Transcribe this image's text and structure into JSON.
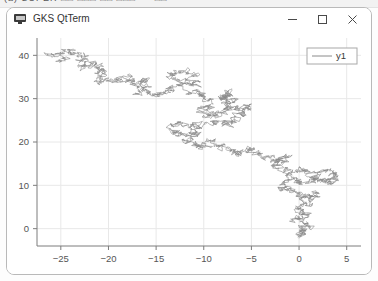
{
  "toolbar_sliver": {
    "text": "(a)  SUPER  □□  □□□  □□  □□□  • •  □□"
  },
  "window": {
    "title": "GKS QtTerm",
    "icon": "monitor-icon",
    "controls": {
      "minimize": "minimize-icon",
      "maximize": "maximize-icon",
      "close": "close-icon"
    }
  },
  "colors": {
    "line": "#8a8a8a",
    "grid": "#e8e8e8",
    "axis": "#7d7d7d",
    "tick_text": "#555555",
    "legend_border": "#a8a8a8",
    "window_border": "#b9b9b9",
    "background": "#ffffff"
  },
  "chart_data": {
    "type": "line",
    "title": "",
    "xlabel": "",
    "ylabel": "",
    "xlim": [
      -27.5,
      6.5
    ],
    "ylim": [
      -4.0,
      44.0
    ],
    "xticks": [
      -25,
      -20,
      -15,
      -10,
      -5,
      0,
      5
    ],
    "yticks": [
      0,
      10,
      20,
      30,
      40
    ],
    "xtick_labels": [
      "−25",
      "−20",
      "−15",
      "−10",
      "−5",
      "0",
      "5"
    ],
    "ytick_labels": [
      "0",
      "10",
      "20",
      "30",
      "40"
    ],
    "grid": true,
    "legend": {
      "position": "upper right",
      "entries": [
        {
          "label": "y1",
          "color": "#8a8a8a",
          "marker": "line"
        }
      ]
    },
    "series": [
      {
        "name": "y1",
        "description": "two-dimensional random walk trajectory",
        "color": "#8a8a8a",
        "linewidth": 0.6,
        "n_points": 2400,
        "start": [
          -24.5,
          39.0
        ],
        "end": [
          0.2,
          -1.5
        ],
        "seed": 20240517,
        "waypoints": [
          [
            -24.5,
            39.0
          ],
          [
            -25.6,
            40.2
          ],
          [
            -23.9,
            41.3
          ],
          [
            -22.4,
            39.6
          ],
          [
            -23.1,
            37.4
          ],
          [
            -21.6,
            38.1
          ],
          [
            -20.3,
            36.2
          ],
          [
            -21.4,
            34.7
          ],
          [
            -19.8,
            33.6
          ],
          [
            -18.2,
            34.9
          ],
          [
            -17.0,
            33.1
          ],
          [
            -15.8,
            34.4
          ],
          [
            -16.9,
            31.8
          ],
          [
            -15.1,
            30.6
          ],
          [
            -13.7,
            31.9
          ],
          [
            -12.4,
            33.6
          ],
          [
            -13.6,
            35.4
          ],
          [
            -12.0,
            36.1
          ],
          [
            -10.6,
            34.2
          ],
          [
            -11.8,
            32.3
          ],
          [
            -10.4,
            31.0
          ],
          [
            -9.1,
            29.4
          ],
          [
            -10.2,
            27.6
          ],
          [
            -9.4,
            25.7
          ],
          [
            -8.1,
            27.2
          ],
          [
            -7.0,
            29.0
          ],
          [
            -8.3,
            30.6
          ],
          [
            -6.9,
            31.4
          ],
          [
            -7.8,
            28.8
          ],
          [
            -6.4,
            27.1
          ],
          [
            -5.1,
            28.4
          ],
          [
            -6.2,
            26.0
          ],
          [
            -7.4,
            24.3
          ],
          [
            -9.0,
            25.1
          ],
          [
            -10.6,
            23.4
          ],
          [
            -12.2,
            24.6
          ],
          [
            -13.5,
            22.9
          ],
          [
            -12.1,
            21.6
          ],
          [
            -10.8,
            22.8
          ],
          [
            -11.9,
            20.4
          ],
          [
            -10.5,
            19.0
          ],
          [
            -9.2,
            20.2
          ],
          [
            -8.0,
            18.6
          ],
          [
            -6.6,
            17.2
          ],
          [
            -5.2,
            18.4
          ],
          [
            -4.0,
            16.8
          ],
          [
            -2.7,
            15.3
          ],
          [
            -1.4,
            16.6
          ],
          [
            -2.6,
            14.2
          ],
          [
            -1.1,
            12.8
          ],
          [
            0.3,
            13.9
          ],
          [
            1.6,
            12.3
          ],
          [
            3.0,
            13.6
          ],
          [
            4.2,
            12.0
          ],
          [
            3.1,
            10.5
          ],
          [
            1.8,
            11.8
          ],
          [
            0.5,
            10.2
          ],
          [
            -0.8,
            11.5
          ],
          [
            -1.9,
            9.9
          ],
          [
            -0.6,
            8.4
          ],
          [
            0.7,
            7.0
          ],
          [
            1.9,
            8.3
          ],
          [
            0.8,
            6.1
          ],
          [
            -0.4,
            4.6
          ],
          [
            0.9,
            3.2
          ],
          [
            -0.2,
            1.8
          ],
          [
            1.0,
            0.6
          ],
          [
            -0.1,
            -0.9
          ],
          [
            0.2,
            -1.5
          ]
        ]
      }
    ]
  }
}
